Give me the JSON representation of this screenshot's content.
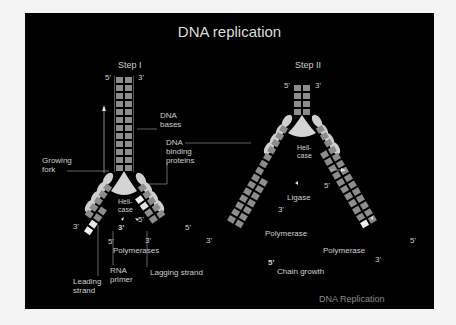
{
  "title": "DNA replication",
  "footer": "DNA Replication",
  "colors": {
    "background": "#000000",
    "base": "#8c8c8c",
    "protein": "#cfcfcf",
    "primer": "#f0f0f0",
    "text": "#cfcfcf"
  },
  "step1": {
    "label": "Step I",
    "top_5": "5'",
    "top_3": "3'",
    "labels": {
      "dna_bases": "DNA\nbases",
      "growing_fork": "Growing\nfork",
      "dna_binding_proteins": "DNA\nbinding\nproteins",
      "helicase": "Heli-\ncase",
      "polymerases": "Polymerases",
      "rna_primer": "RNA\nprimer",
      "leading_strand": "Leading\nstrand",
      "lagging_strand": "Lagging strand"
    },
    "ends": {
      "left_3": "3'",
      "left_inner_3": "3'",
      "left_inner_5": "5'",
      "right_inner_5": "5'",
      "right_inner_3": "3'",
      "right_5": "5'"
    }
  },
  "step2": {
    "label": "Step II",
    "top_5": "5'",
    "top_3": "3'",
    "labels": {
      "helicase": "Heli-\ncase",
      "ligase": "Ligase",
      "polymerase_left": "Polymerase",
      "polymerase_right": "Polymerase",
      "chain_growth": "Chain growth"
    },
    "ends": {
      "left_3": "3'",
      "left_inner_3": "3'",
      "left_5": "5'",
      "right_inner_5": "5'",
      "right_5": "5'",
      "right_inner_3": "3'",
      "outer_3": "3'"
    }
  }
}
